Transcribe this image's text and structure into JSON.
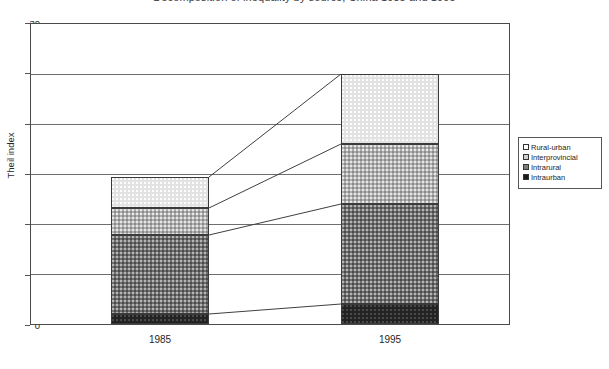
{
  "title": "Decomposition of inequality by source, China 1985 and 1995",
  "axes": {
    "y_title": "Theil index",
    "y_ticks": [
      "0",
      "5",
      "10",
      "15",
      "20",
      "25",
      "30"
    ],
    "y_min": 0,
    "y_max": 30,
    "x_ticks": [
      "1985",
      "1995"
    ]
  },
  "legend": {
    "items": [
      {
        "label": "Rural-urban",
        "key": "rural_urban",
        "swatch": "white"
      },
      {
        "label": "Interprovincial",
        "key": "interprovincial",
        "swatch": "light-gray"
      },
      {
        "label": "Intrarural",
        "key": "intrarural",
        "swatch": "medium-gray"
      },
      {
        "label": "Intraurban",
        "key": "intraurban",
        "swatch": "black"
      }
    ]
  },
  "chart_data": {
    "type": "bar",
    "stacked": true,
    "title": "Decomposition of inequality by source, China 1985 and 1995",
    "xlabel": "",
    "ylabel": "Theil index",
    "ylim": [
      0,
      30
    ],
    "ytick_step": 5,
    "grid": true,
    "legend_position": "right",
    "categories": [
      "1985",
      "1995"
    ],
    "series": [
      {
        "name": "Intraurban",
        "values": [
          1.0,
          2.0
        ]
      },
      {
        "name": "Intrarural",
        "values": [
          7.9,
          10.0
        ]
      },
      {
        "name": "Interprovincial",
        "values": [
          2.7,
          6.0
        ]
      },
      {
        "name": "Rural-urban",
        "values": [
          3.1,
          7.0
        ]
      }
    ],
    "cumulative_tops": {
      "1985": [
        1.0,
        8.9,
        11.6,
        14.7
      ],
      "1995": [
        2.0,
        12.0,
        18.0,
        25.0
      ]
    },
    "totals": [
      14.7,
      25.0
    ],
    "connector_lines": [
      {
        "from": 1.0,
        "to": 2.0
      },
      {
        "from": 8.9,
        "to": 12.0
      },
      {
        "from": 11.6,
        "to": 18.0
      },
      {
        "from": 14.7,
        "to": 25.0
      }
    ]
  }
}
